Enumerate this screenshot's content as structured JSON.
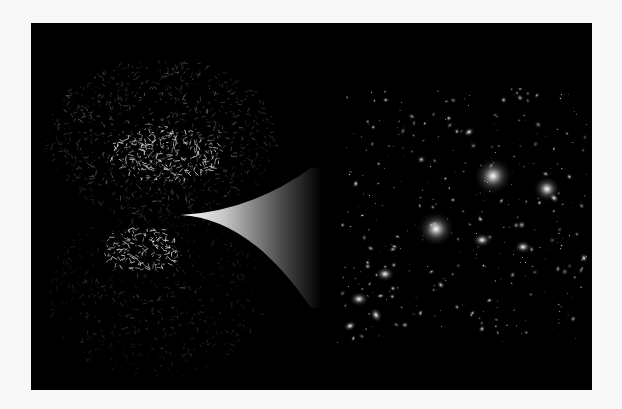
{
  "figure": {
    "background": "#f8f8f8",
    "panel": {
      "x": 31,
      "y": 23,
      "width": 561,
      "height": 367,
      "color": "#000000"
    }
  },
  "left_region": {
    "label": "cosmic-web-simulation",
    "clouds": [
      {
        "cx": 130,
        "cy": 115,
        "rx": 115,
        "ry": 80,
        "density": 900,
        "brightness": 0.75,
        "seed": 11
      },
      {
        "cx": 125,
        "cy": 270,
        "rx": 110,
        "ry": 85,
        "density": 520,
        "brightness": 0.45,
        "seed": 29
      }
    ],
    "dense_cores": [
      {
        "cx": 135,
        "cy": 130,
        "rx": 55,
        "ry": 28,
        "density": 260,
        "seed": 5
      },
      {
        "cx": 110,
        "cy": 225,
        "rx": 40,
        "ry": 22,
        "density": 160,
        "seed": 7
      }
    ]
  },
  "funnel": {
    "tip": [
      150,
      192
    ],
    "top_end": [
      280,
      145
    ],
    "bottom_end": [
      280,
      285
    ],
    "gradient": [
      "#ffffff",
      "#bcbcbc",
      "#555555",
      "#000000"
    ]
  },
  "right_region": {
    "label": "galaxy-field",
    "bounds": {
      "x": 306,
      "y": 65,
      "width": 250,
      "height": 255
    },
    "small_galaxies": 420,
    "seed": 42,
    "large_galaxies": [
      {
        "x": 462,
        "y": 153,
        "r": 20,
        "rot": -20
      },
      {
        "x": 405,
        "y": 206,
        "r": 19,
        "rot": 0
      },
      {
        "x": 516,
        "y": 166,
        "r": 14,
        "rot": 10
      },
      {
        "x": 451,
        "y": 217,
        "r": 10,
        "rot": 0
      },
      {
        "x": 492,
        "y": 224,
        "r": 9,
        "rot": 0
      },
      {
        "x": 354,
        "y": 251,
        "r": 10,
        "rot": 0
      },
      {
        "x": 328,
        "y": 276,
        "r": 10,
        "rot": 0
      },
      {
        "x": 345,
        "y": 292,
        "r": 8,
        "rot": 60
      },
      {
        "x": 438,
        "y": 109,
        "r": 6,
        "rot": -30
      },
      {
        "x": 523,
        "y": 175,
        "r": 6,
        "rot": 40
      },
      {
        "x": 319,
        "y": 303,
        "r": 7,
        "rot": -20
      },
      {
        "x": 553,
        "y": 235,
        "r": 5,
        "rot": 70
      }
    ]
  }
}
